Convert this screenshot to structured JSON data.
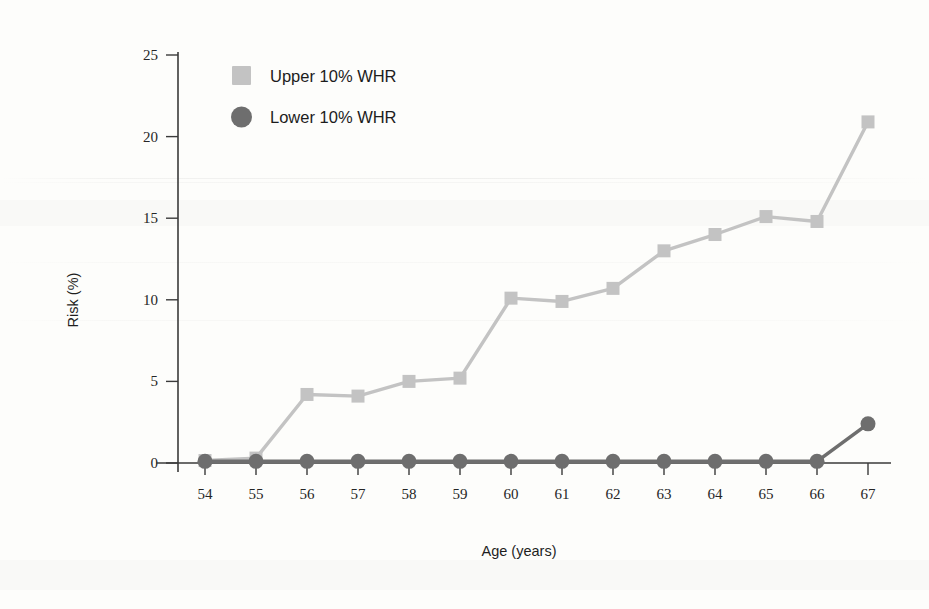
{
  "chart_data": {
    "type": "line",
    "title": "",
    "xlabel": "Age (years)",
    "ylabel": "Risk (%)",
    "x": [
      54,
      55,
      56,
      57,
      58,
      59,
      60,
      61,
      62,
      63,
      64,
      65,
      66,
      67
    ],
    "xtick_labels": [
      "54",
      "55",
      "56",
      "57",
      "58",
      "59",
      "60",
      "61",
      "62",
      "63",
      "64",
      "65",
      "66",
      "67"
    ],
    "ytick_labels": [
      "0",
      "5",
      "10",
      "15",
      "20",
      "25"
    ],
    "yticks": [
      0,
      5,
      10,
      15,
      20,
      25
    ],
    "xlim": [
      54,
      67
    ],
    "ylim": [
      0,
      25
    ],
    "grid": false,
    "legend_position": "top-left-inside",
    "series": [
      {
        "name": "Upper 10% WHR",
        "marker": "square",
        "color": "#c3c3c3",
        "values": [
          0.15,
          0.3,
          4.2,
          4.1,
          5.0,
          5.2,
          10.1,
          9.9,
          10.7,
          13.0,
          14.0,
          15.1,
          14.8,
          20.9
        ]
      },
      {
        "name": "Lower 10% WHR",
        "marker": "circle",
        "color": "#6e6e6e",
        "values": [
          0.1,
          0.1,
          0.1,
          0.1,
          0.1,
          0.1,
          0.1,
          0.1,
          0.1,
          0.1,
          0.1,
          0.1,
          0.1,
          2.4
        ]
      }
    ]
  },
  "legend": {
    "items": [
      {
        "label": "Upper 10% WHR",
        "marker": "square-marker",
        "color": "#c3c3c3"
      },
      {
        "label": "Lower 10% WHR",
        "marker": "circle-marker",
        "color": "#6e6e6e"
      }
    ]
  },
  "axes": {
    "y_title": "Risk (%)",
    "x_title": "Age (years)"
  }
}
